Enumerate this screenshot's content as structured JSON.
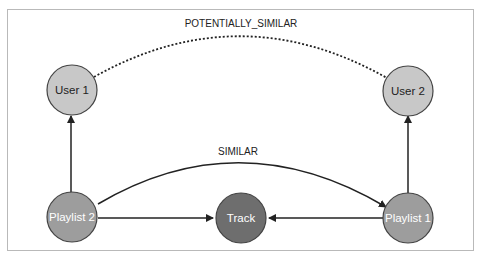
{
  "diagram": {
    "nodes": [
      {
        "id": "user1",
        "label": "User 1",
        "fill": "#c8c8c8",
        "text_color": "#222222"
      },
      {
        "id": "user2",
        "label": "User 2",
        "fill": "#c8c8c8",
        "text_color": "#222222"
      },
      {
        "id": "playlist2",
        "label": "Playlist 2",
        "fill": "#9d9d9d",
        "text_color": "#ffffff"
      },
      {
        "id": "track",
        "label": "Track",
        "fill": "#6e6e6e",
        "text_color": "#ffffff"
      },
      {
        "id": "playlist1",
        "label": "Playlist 1",
        "fill": "#9d9d9d",
        "text_color": "#ffffff"
      }
    ],
    "edges": [
      {
        "from": "user1",
        "to": "user2",
        "label": "POTENTIALLY_SIMILAR",
        "style": "dotted",
        "directed": false
      },
      {
        "from": "playlist2",
        "to": "playlist1",
        "label": "SIMILAR",
        "style": "solid",
        "directed": true
      },
      {
        "from": "playlist2",
        "to": "user1",
        "label": "",
        "style": "solid",
        "directed": true
      },
      {
        "from": "playlist1",
        "to": "user2",
        "label": "",
        "style": "solid",
        "directed": true
      },
      {
        "from": "playlist2",
        "to": "track",
        "label": "",
        "style": "solid",
        "directed": true
      },
      {
        "from": "playlist1",
        "to": "track",
        "label": "",
        "style": "solid",
        "directed": true
      }
    ]
  }
}
